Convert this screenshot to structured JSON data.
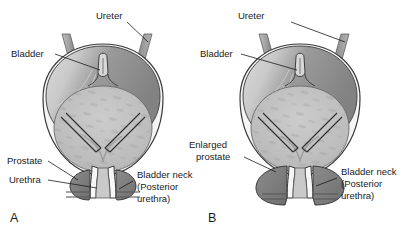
{
  "figure": {
    "background_color": "#ffffff",
    "ink_color": "#1a1a1a"
  },
  "panels": [
    {
      "letter": "A",
      "name": "normal-prostate",
      "labels": [
        {
          "id": "ureter",
          "text": "Ureter",
          "lines": [
            "Ureter"
          ]
        },
        {
          "id": "bladder",
          "text": "Bladder",
          "lines": [
            "Bladder"
          ]
        },
        {
          "id": "prostate",
          "text": "Prostate",
          "lines": [
            "Prostate"
          ]
        },
        {
          "id": "urethra",
          "text": "Urethra",
          "lines": [
            "Urethra"
          ]
        },
        {
          "id": "bladder-neck",
          "text": "Bladder neck (Posterior urethra)",
          "lines": [
            "Bladder neck",
            "(Posterior",
            "urethra)"
          ]
        }
      ]
    },
    {
      "letter": "B",
      "name": "enlarged-prostate",
      "labels": [
        {
          "id": "ureter",
          "text": "Ureter",
          "lines": [
            "Ureter"
          ]
        },
        {
          "id": "bladder",
          "text": "Bladder",
          "lines": [
            "Bladder"
          ]
        },
        {
          "id": "enlarged-prostate",
          "text": "Enlarged prostate",
          "lines": [
            "Enlarged",
            "prostate"
          ]
        },
        {
          "id": "bladder-neck",
          "text": "Bladder neck (Posterior urethra)",
          "lines": [
            "Bladder neck",
            "(Posterior",
            "urethra)"
          ]
        }
      ]
    }
  ],
  "colors": {
    "bladder_dome_dark": "#8e8e8e",
    "bladder_dome_mid": "#a8a8a8",
    "bladder_wall_light": "#f2f2f2",
    "bladder_interior": "#bdbdbd",
    "bladder_interior_mottle": "#a3a3a3",
    "prostate": "#7d7d7d",
    "ureter_tube": "#9a9a9a",
    "outline": "#3a3a3a"
  }
}
